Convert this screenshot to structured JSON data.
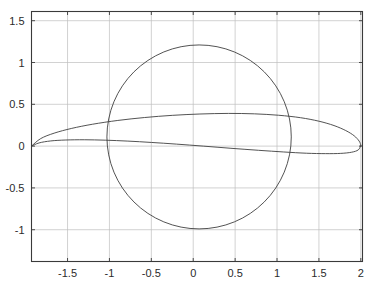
{
  "figure": {
    "background_color": "#ffffff",
    "axes_color": "#3a3a3a",
    "grid_color": "#bfbfbf",
    "curve_color": "#404040",
    "tick_text_color": "#2b2b2b"
  },
  "chart_data": {
    "type": "line",
    "title": "",
    "subtitle": "",
    "xlabel": "",
    "ylabel": "",
    "legend": [],
    "legend_position": "none",
    "grid": true,
    "xlim": [
      -1.93,
      2.02
    ],
    "ylim": [
      -1.38,
      1.61
    ],
    "xticks": [
      -1.5,
      -1,
      -0.5,
      0,
      0.5,
      1,
      1.5,
      2
    ],
    "xtick_labels": [
      "-1.5",
      "-1",
      "-0.5",
      "0",
      "0.5",
      "1",
      "1.5",
      "2"
    ],
    "yticks": [
      1.5,
      1,
      0.5,
      0,
      -0.5,
      -1
    ],
    "ytick_labels": [
      "1.5",
      "1",
      "0.5",
      "0",
      "-0.5",
      "-1"
    ],
    "series": [
      {
        "name": "circle",
        "shape": "circle",
        "center": [
          0.07,
          0.11
        ],
        "radius": 1.1,
        "closed": true,
        "x": [
          1.17,
          1.146,
          1.077,
          0.965,
          0.815,
          0.634,
          0.43,
          0.212,
          -0.011,
          -0.228,
          -0.43,
          -0.608,
          -0.753,
          -0.861,
          -0.926,
          -0.948,
          -0.926,
          -0.861,
          -0.753,
          -0.608,
          -0.43,
          -0.228,
          -0.011,
          0.212,
          0.43,
          0.634,
          0.815,
          0.965,
          1.077,
          1.146,
          1.17
        ],
        "y": [
          0.11,
          0.394,
          0.665,
          0.909,
          1.113,
          1.263,
          1.352,
          1.374,
          1.33,
          1.222,
          1.055,
          0.84,
          0.589,
          0.314,
          0.028,
          -0.256,
          -0.541,
          -0.822,
          -1.065,
          -1.262,
          -1.38,
          -1.41,
          -1.36,
          -1.23,
          -1.02,
          -0.76,
          -0.47,
          -0.16,
          0.16,
          0.44,
          0.11
        ]
      },
      {
        "name": "joukowski-airfoil-upper",
        "shape": "curve",
        "closed": false,
        "x": [
          -1.93,
          -1.82,
          -1.66,
          -1.45,
          -1.2,
          -0.9,
          -0.58,
          -0.25,
          0.08,
          0.42,
          0.73,
          1.02,
          1.28,
          1.5,
          1.68,
          1.82,
          1.92,
          1.98,
          2.0
        ],
        "y": [
          0.0,
          0.09,
          0.155,
          0.212,
          0.262,
          0.307,
          0.342,
          0.368,
          0.384,
          0.391,
          0.386,
          0.369,
          0.34,
          0.298,
          0.246,
          0.186,
          0.124,
          0.06,
          0.01
        ]
      },
      {
        "name": "joukowski-airfoil-lower",
        "shape": "curve",
        "closed": false,
        "x": [
          -1.93,
          -1.84,
          -1.7,
          -1.52,
          -1.3,
          -1.05,
          -0.78,
          -0.5,
          -0.2,
          0.12,
          0.45,
          0.78,
          1.08,
          1.35,
          1.58,
          1.76,
          1.89,
          1.97,
          2.0
        ],
        "y": [
          0.0,
          0.038,
          0.062,
          0.073,
          0.076,
          0.071,
          0.06,
          0.044,
          0.024,
          0.0,
          -0.026,
          -0.05,
          -0.07,
          -0.085,
          -0.09,
          -0.087,
          -0.073,
          -0.045,
          0.01
        ]
      }
    ],
    "annotations": []
  }
}
